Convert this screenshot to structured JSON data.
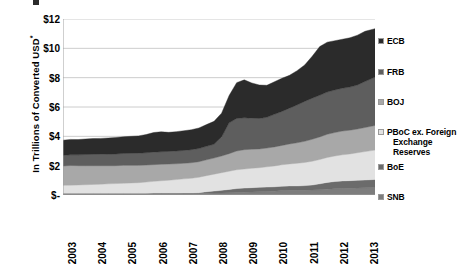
{
  "chart_data": {
    "type": "area",
    "stacked": true,
    "title": "",
    "xlabel": "",
    "ylabel": "In Trillions of Converted USD*",
    "ylabel_text": "In Trillions of Converted USD",
    "ylabel_superscript": "*",
    "ylim": [
      0,
      12
    ],
    "y_ticks": [
      0,
      2,
      4,
      6,
      8,
      10,
      12
    ],
    "y_tick_labels": [
      "$-",
      "$2",
      "$4",
      "$6",
      "$8",
      "$10",
      "$12"
    ],
    "grid": true,
    "grid_axis": "y",
    "legend_position": "right",
    "x_tick_labels": [
      "2003",
      "2004",
      "2005",
      "2006",
      "2007",
      "2008",
      "2009",
      "2010",
      "2011",
      "2012",
      "2013"
    ],
    "x_range": [
      2003,
      2013.33
    ],
    "x": [
      2003.0,
      2003.25,
      2003.5,
      2003.75,
      2004.0,
      2004.25,
      2004.5,
      2004.75,
      2005.0,
      2005.25,
      2005.5,
      2005.75,
      2006.0,
      2006.25,
      2006.5,
      2006.75,
      2007.0,
      2007.25,
      2007.5,
      2007.75,
      2008.0,
      2008.25,
      2008.5,
      2008.75,
      2009.0,
      2009.25,
      2009.5,
      2009.75,
      2010.0,
      2010.25,
      2010.5,
      2010.75,
      2011.0,
      2011.25,
      2011.5,
      2011.75,
      2012.0,
      2012.25,
      2012.5,
      2012.75,
      2013.0,
      2013.33
    ],
    "series": [
      {
        "name": "SNB",
        "color": "#7d7d7d",
        "stack_order": 1,
        "values": [
          0.08,
          0.08,
          0.08,
          0.08,
          0.08,
          0.08,
          0.08,
          0.08,
          0.08,
          0.08,
          0.08,
          0.08,
          0.09,
          0.09,
          0.09,
          0.09,
          0.09,
          0.09,
          0.1,
          0.12,
          0.13,
          0.14,
          0.16,
          0.18,
          0.19,
          0.2,
          0.22,
          0.24,
          0.26,
          0.3,
          0.32,
          0.32,
          0.32,
          0.34,
          0.36,
          0.4,
          0.42,
          0.44,
          0.46,
          0.48,
          0.5,
          0.52
        ]
      },
      {
        "name": "BoE",
        "color": "#6b6b6b",
        "stack_order": 2,
        "values": [
          0.04,
          0.04,
          0.04,
          0.04,
          0.04,
          0.04,
          0.04,
          0.04,
          0.04,
          0.04,
          0.04,
          0.04,
          0.04,
          0.04,
          0.04,
          0.04,
          0.05,
          0.05,
          0.06,
          0.1,
          0.14,
          0.18,
          0.22,
          0.26,
          0.28,
          0.3,
          0.3,
          0.3,
          0.3,
          0.3,
          0.3,
          0.3,
          0.32,
          0.34,
          0.4,
          0.46,
          0.5,
          0.52,
          0.52,
          0.52,
          0.52,
          0.54
        ]
      },
      {
        "name": "PBoC ex. Foreign Exchange Reserves",
        "color": "#e2e2e2",
        "stack_order": 3,
        "values": [
          0.54,
          0.55,
          0.56,
          0.58,
          0.6,
          0.62,
          0.64,
          0.66,
          0.68,
          0.7,
          0.72,
          0.76,
          0.8,
          0.84,
          0.88,
          0.92,
          0.96,
          1.0,
          1.05,
          1.1,
          1.15,
          1.2,
          1.24,
          1.28,
          1.3,
          1.32,
          1.34,
          1.38,
          1.42,
          1.46,
          1.5,
          1.54,
          1.58,
          1.62,
          1.66,
          1.7,
          1.74,
          1.78,
          1.82,
          1.88,
          1.94,
          2.0
        ]
      },
      {
        "name": "BOJ",
        "color": "#a8a8a8",
        "stack_order": 4,
        "values": [
          1.32,
          1.34,
          1.32,
          1.3,
          1.28,
          1.26,
          1.24,
          1.22,
          1.22,
          1.2,
          1.18,
          1.16,
          1.14,
          1.12,
          1.1,
          1.08,
          1.06,
          1.06,
          1.06,
          1.08,
          1.1,
          1.14,
          1.2,
          1.28,
          1.32,
          1.3,
          1.28,
          1.28,
          1.3,
          1.32,
          1.36,
          1.4,
          1.44,
          1.5,
          1.54,
          1.58,
          1.6,
          1.62,
          1.62,
          1.62,
          1.64,
          1.68
        ]
      },
      {
        "name": "FRB",
        "color": "#5e5e5e",
        "stack_order": 5,
        "values": [
          0.72,
          0.73,
          0.74,
          0.76,
          0.77,
          0.78,
          0.79,
          0.8,
          0.81,
          0.82,
          0.83,
          0.84,
          0.85,
          0.86,
          0.86,
          0.87,
          0.88,
          0.89,
          0.9,
          0.92,
          0.94,
          1.3,
          2.1,
          2.22,
          2.18,
          2.12,
          2.08,
          2.1,
          2.22,
          2.32,
          2.44,
          2.58,
          2.72,
          2.8,
          2.84,
          2.88,
          2.9,
          2.92,
          2.94,
          3.0,
          3.14,
          3.3
        ]
      },
      {
        "name": "ECB",
        "color": "#2b2b2b",
        "stack_order": 6,
        "values": [
          1.04,
          1.05,
          1.04,
          1.06,
          1.08,
          1.08,
          1.1,
          1.12,
          1.14,
          1.16,
          1.18,
          1.24,
          1.34,
          1.36,
          1.3,
          1.32,
          1.34,
          1.36,
          1.4,
          1.48,
          1.56,
          1.62,
          1.86,
          2.44,
          2.58,
          2.4,
          2.28,
          2.18,
          2.22,
          2.26,
          2.24,
          2.34,
          2.48,
          2.86,
          3.32,
          3.4,
          3.36,
          3.34,
          3.36,
          3.4,
          3.42,
          3.3
        ]
      }
    ]
  },
  "legend": {
    "items": [
      {
        "label": "ECB",
        "color": "#2b2b2b"
      },
      {
        "label": "FRB",
        "color": "#5e5e5e"
      },
      {
        "label": "BOJ",
        "color": "#a8a8a8"
      },
      {
        "label": "PBoC ex. Foreign",
        "label2": "Exchange Reserves",
        "color": "#e2e2e2"
      },
      {
        "label": "BoE",
        "color": "#6b6b6b"
      },
      {
        "label": "SNB",
        "color": "#7d7d7d"
      }
    ]
  }
}
